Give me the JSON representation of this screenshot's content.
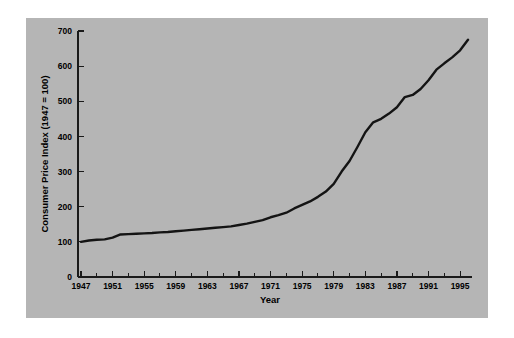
{
  "figure": {
    "background_color": "#ffffff",
    "panel_color": "#b5b5b5",
    "line_color": "#141414",
    "text_color": "#000000"
  },
  "chart_data": {
    "type": "line",
    "title": "",
    "xlabel": "Year",
    "ylabel": "Consumer Price Index (1947 = 100)",
    "xlim": [
      1947,
      1996
    ],
    "ylim": [
      0,
      700
    ],
    "grid": false,
    "legend": "none",
    "y_ticks": [
      0,
      100,
      200,
      300,
      400,
      500,
      600,
      700
    ],
    "y_tick_labels": [
      "0",
      "100",
      "200",
      "300",
      "400",
      "500",
      "600",
      "700"
    ],
    "x_ticks": [
      1947,
      1951,
      1955,
      1959,
      1963,
      1967,
      1971,
      1975,
      1979,
      1983,
      1987,
      1991,
      1995
    ],
    "x_tick_labels": [
      "1947",
      "1951",
      "1955",
      "1959",
      "1963",
      "1967",
      "1971",
      "1975",
      "1979",
      "1983",
      "1987",
      "1991",
      "1995"
    ],
    "x_minor_interval": 2,
    "series": [
      {
        "name": "Consumer Price Index",
        "x": [
          1947,
          1948,
          1949,
          1950,
          1951,
          1952,
          1953,
          1954,
          1955,
          1956,
          1957,
          1958,
          1959,
          1960,
          1961,
          1962,
          1963,
          1964,
          1965,
          1966,
          1967,
          1968,
          1969,
          1970,
          1971,
          1972,
          1973,
          1974,
          1975,
          1976,
          1977,
          1978,
          1979,
          1980,
          1981,
          1982,
          1983,
          1984,
          1985,
          1986,
          1987,
          1988,
          1989,
          1990,
          1991,
          1992,
          1993,
          1994,
          1995,
          1996
        ],
        "values": [
          100,
          104,
          106,
          107,
          112,
          121,
          122,
          123,
          124,
          125,
          127,
          128,
          130,
          132,
          134,
          136,
          138,
          140,
          142,
          144,
          148,
          152,
          157,
          162,
          170,
          176,
          183,
          195,
          205,
          215,
          228,
          243,
          265,
          300,
          330,
          370,
          412,
          440,
          450,
          465,
          483,
          512,
          518,
          535,
          560,
          590,
          608,
          625,
          645,
          675
        ],
        "line_color": "#141414",
        "line_width": 2.4
      }
    ]
  }
}
